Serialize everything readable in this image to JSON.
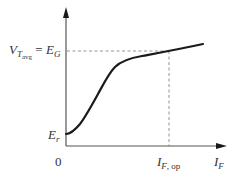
{
  "diagram": {
    "type": "characteristic-curve",
    "colors": {
      "axis": "#555555",
      "curve": "#1a1a1a",
      "dashed": "#888888",
      "text": "#333333",
      "background": "#ffffff"
    },
    "labels": {
      "y_level": {
        "main": "V",
        "sub": "T",
        "subsub": "avg",
        "equals": " = ",
        "rhs_main": "E",
        "rhs_sub": "G"
      },
      "y_intercept": {
        "main": "E",
        "sub": "r"
      },
      "origin": "0",
      "x_op": {
        "main": "I",
        "sub": "F",
        "sub_rest": ", op"
      },
      "x_axis": {
        "main": "I",
        "sub": "F"
      }
    },
    "geometry": {
      "origin": [
        66,
        146
      ],
      "x_axis_end": [
        226,
        146
      ],
      "y_axis_end": [
        66,
        8
      ],
      "dashed_horizontal_y": 51,
      "dashed_vertical_x": 169,
      "curve_points": [
        [
          66,
          134
        ],
        [
          72,
          132
        ],
        [
          80,
          124
        ],
        [
          95,
          99
        ],
        [
          107,
          78
        ],
        [
          115,
          67
        ],
        [
          125,
          61
        ],
        [
          140,
          57
        ],
        [
          169,
          51
        ],
        [
          203,
          44
        ]
      ]
    }
  }
}
